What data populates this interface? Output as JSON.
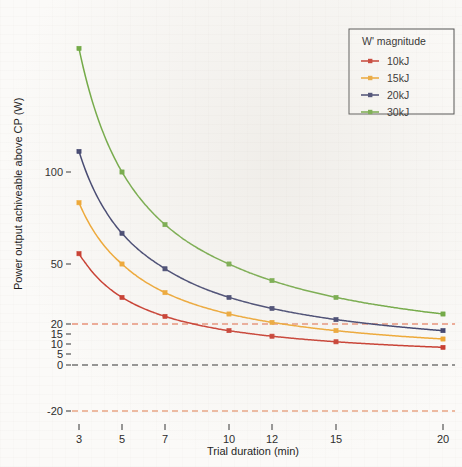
{
  "chart_data": {
    "type": "line",
    "title": "",
    "xlabel": "Trial duration (min)",
    "ylabel": "Power output achiveable above CP (W)",
    "x": [
      3,
      5,
      7,
      10,
      12,
      15,
      20
    ],
    "xtick_labels": [
      "3",
      "5",
      "7",
      "10",
      "12",
      "15",
      "20"
    ],
    "ytick_labels": [
      "-20",
      "0",
      "5",
      "10",
      "15",
      "20",
      "50",
      "100"
    ],
    "ytick_values": [
      -20,
      0,
      5,
      10,
      15,
      20,
      50,
      100
    ],
    "ylim": [
      -26,
      175
    ],
    "xlim": [
      2.4,
      21.2
    ],
    "grid": false,
    "legend_position": "top-right",
    "legend_title": "W' magnitude",
    "series": [
      {
        "name": "10kJ",
        "color": "#c8372a",
        "marker": "square",
        "values": [
          55.6,
          33.3,
          23.8,
          16.7,
          13.9,
          11.1,
          8.3
        ]
      },
      {
        "name": "15kJ",
        "color": "#f0a62e",
        "marker": "square",
        "values": [
          83.3,
          50.0,
          35.7,
          25.0,
          20.8,
          16.7,
          12.5
        ]
      },
      {
        "name": "20kJ",
        "color": "#3b3f6b",
        "marker": "square",
        "values": [
          111.1,
          66.7,
          47.6,
          33.3,
          27.8,
          22.2,
          16.7
        ]
      },
      {
        "name": "30kJ",
        "color": "#6da83f",
        "marker": "square",
        "values": [
          166.7,
          100.0,
          71.4,
          50.0,
          41.7,
          33.3,
          25.0
        ]
      }
    ],
    "reference_lines": [
      {
        "name": "upper-threshold",
        "value": 20,
        "color": "#e05a34",
        "style": "dashed"
      },
      {
        "name": "zero-line",
        "value": 0,
        "color": "#2f2f2f",
        "style": "dashed"
      },
      {
        "name": "lower-threshold",
        "value": -20,
        "color": "#e07a4a",
        "style": "dashed"
      }
    ]
  },
  "legend": {
    "title": "W' magnitude",
    "items": [
      {
        "label": "10kJ",
        "color": "#c8372a"
      },
      {
        "label": "15kJ",
        "color": "#f0a62e"
      },
      {
        "label": "20kJ",
        "color": "#3b3f6b"
      },
      {
        "label": "30kJ",
        "color": "#6da83f"
      }
    ]
  },
  "axes": {
    "x_title": "Trial duration (min)",
    "y_title": "Power output achiveable above CP (W)"
  }
}
